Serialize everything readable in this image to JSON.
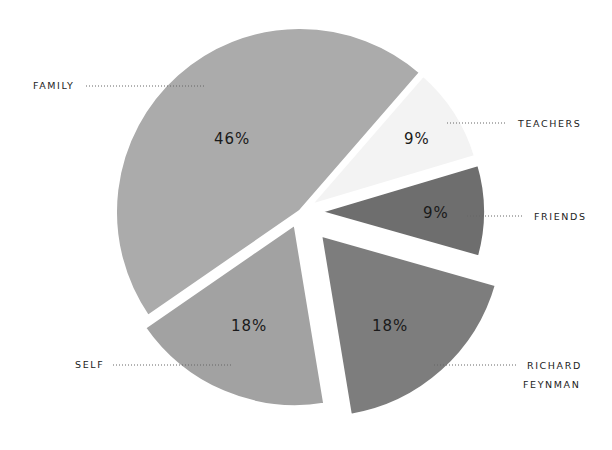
{
  "chart_data": {
    "type": "pie",
    "title": "",
    "exploded": true,
    "slices": [
      {
        "key": "teachers",
        "label": "TEACHERS",
        "value": 9,
        "pct_label": "9%",
        "color": "#f3f3f3"
      },
      {
        "key": "friends",
        "label": "FRIENDS",
        "value": 9,
        "pct_label": "9%",
        "color": "#6e6e6e"
      },
      {
        "key": "feynman",
        "label": "RICHARD FEYNMAN",
        "label_lines": [
          "RICHARD",
          "FEYNMAN"
        ],
        "value": 18,
        "pct_label": "18%",
        "color": "#7d7d7d"
      },
      {
        "key": "self",
        "label": "SELF",
        "value": 18,
        "pct_label": "18%",
        "color": "#a2a2a2"
      },
      {
        "key": "family",
        "label": "FAMILY",
        "value": 46,
        "pct_label": "46%",
        "color": "#ababab"
      }
    ],
    "categories": [
      "FAMILY",
      "SELF",
      "RICHARD FEYNMAN",
      "FRIENDS",
      "TEACHERS"
    ],
    "values": [
      46,
      18,
      18,
      9,
      9
    ],
    "legend": "none (callout labels with dotted leader lines)"
  },
  "labels": {
    "family": "FAMILY",
    "teachers": "TEACHERS",
    "friends": "FRIENDS",
    "feynman_line1": "RICHARD",
    "feynman_line2": "FEYNMAN",
    "self": "SELF"
  },
  "pct": {
    "family": "46%",
    "teachers": "9%",
    "friends": "9%",
    "feynman": "18%",
    "self": "18%"
  }
}
